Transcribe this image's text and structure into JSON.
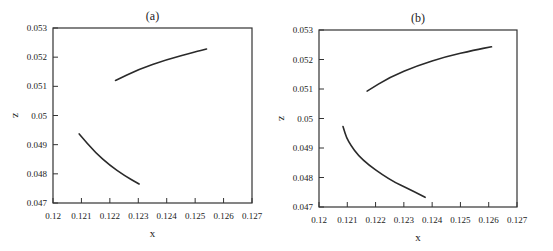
{
  "chart_data": [
    {
      "type": "line",
      "title": "(a)",
      "xlabel": "x",
      "ylabel": "z",
      "xlim": [
        0.12,
        0.127
      ],
      "ylim": [
        0.047,
        0.053
      ],
      "xticks": [
        "0.12",
        "0.121",
        "0.122",
        "0.123",
        "0.124",
        "0.125",
        "0.126",
        "0.127"
      ],
      "yticks": [
        "0.047",
        "0.048",
        "0.049",
        "0.05",
        "0.051",
        "0.052",
        "0.053"
      ],
      "grid": false,
      "legend": null,
      "series": [
        {
          "name": "upper branch",
          "x": [
            0.1222,
            0.123,
            0.124,
            0.125,
            0.1254
          ],
          "y": [
            0.0512,
            0.05158,
            0.05192,
            0.05218,
            0.05228
          ]
        },
        {
          "name": "lower branch",
          "x": [
            0.12092,
            0.1215,
            0.122,
            0.1225,
            0.12303
          ],
          "y": [
            0.04937,
            0.04872,
            0.04829,
            0.04795,
            0.04765
          ]
        }
      ]
    },
    {
      "type": "line",
      "title": "(b)",
      "xlabel": "x",
      "ylabel": "z",
      "xlim": [
        0.12,
        0.127
      ],
      "ylim": [
        0.047,
        0.053
      ],
      "xticks": [
        "0.12",
        "0.121",
        "0.122",
        "0.123",
        "0.124",
        "0.125",
        "0.126",
        "0.127"
      ],
      "yticks": [
        "0.047",
        "0.048",
        "0.049",
        "0.05",
        "0.051",
        "0.052",
        "0.053"
      ],
      "grid": false,
      "legend": null,
      "series": [
        {
          "name": "upper branch",
          "x": [
            0.1217,
            0.1225,
            0.1235,
            0.1245,
            0.1255,
            0.1261
          ],
          "y": [
            0.05093,
            0.0514,
            0.0518,
            0.0521,
            0.05232,
            0.05243
          ]
        },
        {
          "name": "lower branch",
          "x": [
            0.12085,
            0.121,
            0.1215,
            0.1225,
            0.1233,
            0.12375
          ],
          "y": [
            0.04973,
            0.04925,
            0.0486,
            0.04792,
            0.04755,
            0.04733
          ]
        }
      ]
    }
  ]
}
